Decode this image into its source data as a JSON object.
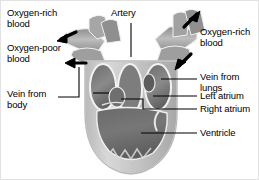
{
  "figure": {
    "type": "anatomical-diagram",
    "colors": {
      "background": "#ffffff",
      "text": "#000000",
      "leader_line": "#000000",
      "arrow": "#000000",
      "tissue_light": "#cfcfcf",
      "tissue_mid": "#9a9a9a",
      "tissue_dark": "#6e6e6e",
      "chamber_dark": "#5a5a5a",
      "outline_white": "#f2f2f2",
      "border": "#e2e2e2"
    }
  },
  "labels": {
    "oxygen_rich_left": "Oxygen-rich\nblood",
    "oxygen_poor_left": "Oxygen-poor\nblood",
    "vein_from_body": "Vein from\nbody",
    "artery": "Artery",
    "oxygen_rich_right": "Oxygen-rich\nblood",
    "vein_from_lungs": "Vein from\nlungs",
    "left_atrium": "Left atrium",
    "right_atrium": "Right atrium",
    "ventricle": "Ventricle"
  },
  "arrows": [
    {
      "name": "oxygen-rich-outflow-left",
      "direction": "up-left"
    },
    {
      "name": "oxygen-poor-inflow-left",
      "direction": "left"
    },
    {
      "name": "oxygen-rich-outflow-right",
      "direction": "up-right"
    },
    {
      "name": "vein-from-lungs-inflow-right",
      "direction": "down-left"
    }
  ],
  "structures": [
    {
      "name": "artery",
      "label": "Artery"
    },
    {
      "name": "vein-from-body",
      "label": "Vein from body"
    },
    {
      "name": "vein-from-lungs",
      "label": "Vein from lungs"
    },
    {
      "name": "left-atrium",
      "label": "Left atrium"
    },
    {
      "name": "right-atrium",
      "label": "Right atrium"
    },
    {
      "name": "ventricle",
      "label": "Ventricle"
    }
  ]
}
